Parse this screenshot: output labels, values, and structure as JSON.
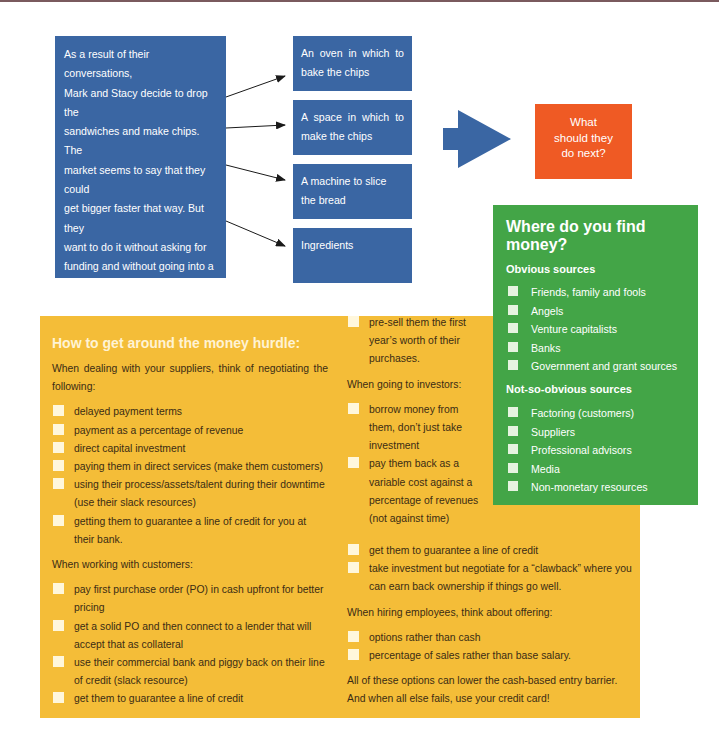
{
  "story": {
    "lines": [
      "As a result of their conversations,",
      "Mark and Stacy decide to drop the",
      "sandwiches and make chips. The",
      "market seems to say that they could",
      "get bigger faster that way. But they",
      "want to do it without asking for",
      "funding and without going into a",
      "partnership. With their debt still",
      "looming, Mark and Stacy look for",
      "ways to make chips while spending",
      "as little as possible. But they need",
      "some things:"
    ]
  },
  "needs": [
    {
      "label": "An oven in which to bake the chips"
    },
    {
      "label": "A space in which to make the chips"
    },
    {
      "label": "A machine to slice the bread"
    },
    {
      "label": "Ingredients"
    }
  ],
  "question": {
    "lines": [
      "What",
      "should they",
      "do next?"
    ]
  },
  "colors": {
    "blue": "#3a66a3",
    "orange": "#ef5a24",
    "yellow": "#f4bd38",
    "green": "#43a547"
  },
  "hurdle": {
    "title": "How to get around the money hurdle:",
    "suppliers_intro": "When dealing with your suppliers, think of negotiating the following:",
    "suppliers": [
      "delayed payment terms",
      "payment as a percentage of revenue",
      "direct capital investment",
      "paying them in direct services (make them customers)",
      "using their process/assets/talent during their downtime (use their slack resources)",
      "getting them to guarantee a line of credit for you at their bank."
    ],
    "customers_intro": "When working with customers:",
    "customers": [
      "pay first purchase order (PO) in cash upfront for better pricing",
      "get a solid PO and then connect to a lender that will accept that as collateral",
      "use their commercial bank and piggy back on their line of credit (slack resource)",
      "get them to guarantee a line of credit",
      "pre-sell them the first year’s worth of their purchases."
    ],
    "investors_intro": "When going to investors:",
    "investors": [
      "borrow money from them, don’t just take investment",
      "pay them back as a variable cost against a percentage of revenues (not against time)",
      "get them to guarantee a line of credit",
      "take investment but negotiate for a “clawback” where you can earn back ownership if things go well."
    ],
    "employees_intro": "When hiring employees, think about offering:",
    "employees": [
      "options rather than cash",
      "percentage of sales rather than base salary."
    ],
    "closing": "All of these options can lower the cash-based entry barrier. And when all else fails, use your credit card!"
  },
  "money": {
    "title": "Where do you find money?",
    "obvious_heading": "Obvious sources",
    "obvious": [
      "Friends, family and fools",
      "Angels",
      "Venture capitalists",
      "Banks",
      "Government and grant sources"
    ],
    "nonobvious_heading": "Not-so-obvious sources",
    "nonobvious": [
      "Factoring (customers)",
      "Suppliers",
      "Professional advisors",
      "Media",
      "Non-monetary resources"
    ]
  }
}
